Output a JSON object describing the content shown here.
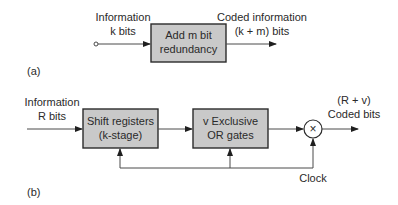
{
  "diagram_a": {
    "panel_label": "(a)",
    "input_label_line1": "Information",
    "input_label_line2": "k bits",
    "box_line1": "Add m bit",
    "box_line2": "redundancy",
    "output_label_line1": "Coded information",
    "output_label_line2": "(k + m) bits"
  },
  "diagram_b": {
    "panel_label": "(b)",
    "input_label_line1": "Information",
    "input_label_line2": "R bits",
    "box1_line1": "Shift registers",
    "box1_line2": "(k-stage)",
    "box2_line1": "v Exclusive",
    "box2_line2": "OR gates",
    "multiplier_symbol": "×",
    "output_label_line1": "(R + v)",
    "output_label_line2": "Coded bits",
    "clock_label": "Clock"
  },
  "colors": {
    "box_fill": "#c9c9c9",
    "box_stroke": "#2b2b2b",
    "line": "#4a4a4a",
    "text": "#2a2a2a"
  }
}
